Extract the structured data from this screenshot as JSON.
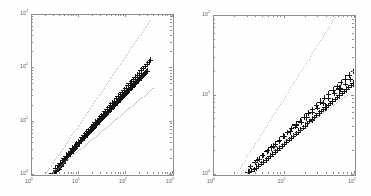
{
  "figure": {
    "background_color": "#fefefe",
    "axis_color": "#8d8d8d",
    "marker_color": "#141414",
    "guide_color": "#6f6f6f",
    "panel_count": 2
  },
  "chart_data": [
    {
      "type": "scatter",
      "title": "",
      "subtitle": "",
      "xlabel": "",
      "ylabel": "",
      "xscale": "log",
      "yscale": "log",
      "xlim": [
        1,
        1000
      ],
      "ylim": [
        1,
        1000
      ],
      "grid": false,
      "legend": null,
      "xtick_labels": [
        "10^0",
        "10^1",
        "10^2",
        "10^3"
      ],
      "ytick_labels": [
        "10^0",
        "10^1",
        "10^2",
        "10^3"
      ],
      "xticks": [
        1,
        10,
        100,
        1000
      ],
      "yticks": [
        1,
        10,
        100,
        1000
      ],
      "marker": "+",
      "annotations": [],
      "series": [
        {
          "name": "data",
          "marker": "+",
          "x": [
            2.9,
            3.1,
            3.2,
            3.4,
            3.5,
            3.6,
            3.8,
            3.9,
            4.0,
            4.2,
            4.4,
            4.5,
            4.7,
            4.9,
            5.1,
            5.3,
            5.5,
            5.8,
            6.0,
            6.3,
            6.6,
            6.9,
            7.2,
            7.5,
            7.9,
            8.2,
            8.6,
            9.0,
            9.4,
            9.8,
            10.3,
            10.8,
            11.3,
            11.8,
            12.4,
            13.0,
            13.6,
            14.2,
            14.9,
            15.6,
            16.4,
            17.2,
            18.0,
            18.9,
            19.8,
            20.8,
            21.8,
            22.8,
            24.0,
            25.1,
            26.4,
            27.7,
            29.0,
            30.5,
            32.0,
            33.6,
            35.2,
            37.0,
            38.8,
            40.7,
            42.8,
            44.9,
            47.2,
            49.5,
            52.0,
            54.6,
            57.4,
            60.3,
            63.3,
            66.5,
            69.9,
            73.4,
            77.1,
            81.0,
            85.1,
            89.4,
            93.9,
            98.6,
            103.6,
            108.9,
            114.4,
            120.2,
            126.3,
            132.7,
            139.4,
            146.5,
            153.9,
            161.7,
            169.9,
            178.5,
            187.5,
            197.0,
            207.0,
            217.5,
            228.5,
            240.0,
            252.2,
            265.0,
            278.4,
            292.5,
            3.3,
            3.7,
            4.1,
            4.6,
            5.0,
            5.6,
            6.2,
            6.8,
            7.6,
            8.4,
            9.2,
            10.1,
            11.1,
            12.2,
            13.4,
            14.7,
            16.1,
            17.7,
            19.4,
            21.3,
            23.4,
            25.7,
            28.2,
            31.0,
            34.0,
            37.3,
            41.0,
            45.0,
            49.4,
            54.2,
            59.5,
            65.3,
            71.7,
            78.7,
            86.4,
            94.9,
            104.2,
            114.4,
            125.6,
            137.9,
            151.4,
            166.2,
            182.5,
            200.4,
            220.0,
            241.5,
            265.2,
            291.2,
            319.7,
            351.0
          ],
          "y": [
            1.02,
            1.05,
            1.08,
            1.12,
            1.15,
            1.2,
            1.25,
            1.3,
            1.35,
            1.42,
            1.48,
            1.55,
            1.62,
            1.7,
            1.78,
            1.86,
            1.95,
            2.05,
            2.15,
            2.25,
            2.36,
            2.47,
            2.59,
            2.71,
            2.85,
            2.98,
            3.12,
            3.27,
            3.42,
            3.58,
            3.75,
            3.93,
            4.11,
            4.3,
            4.5,
            4.71,
            4.93,
            5.16,
            5.4,
            5.65,
            5.91,
            6.19,
            6.47,
            6.77,
            7.08,
            7.41,
            7.75,
            8.11,
            8.49,
            8.88,
            9.29,
            9.72,
            10.17,
            10.64,
            11.13,
            11.65,
            12.19,
            12.75,
            13.34,
            13.96,
            14.61,
            15.29,
            16.0,
            16.74,
            17.52,
            18.33,
            19.18,
            20.07,
            21.0,
            21.97,
            22.99,
            24.05,
            25.17,
            26.33,
            27.55,
            28.83,
            30.16,
            31.56,
            33.03,
            34.56,
            36.16,
            37.84,
            39.6,
            41.44,
            43.36,
            45.38,
            47.49,
            49.7,
            52.01,
            54.43,
            56.96,
            59.61,
            62.38,
            65.28,
            68.32,
            71.5,
            74.82,
            78.3,
            81.94,
            85.75,
            1.3,
            1.45,
            1.6,
            1.8,
            1.95,
            2.2,
            2.45,
            2.7,
            3.0,
            3.3,
            3.65,
            4.0,
            4.4,
            4.85,
            5.3,
            5.85,
            6.4,
            7.0,
            7.7,
            8.45,
            9.3,
            10.2,
            11.2,
            12.3,
            13.5,
            14.8,
            16.3,
            17.9,
            19.6,
            21.5,
            23.6,
            25.9,
            28.5,
            31.2,
            34.3,
            37.6,
            41.3,
            45.4,
            49.8,
            54.7,
            60.0,
            65.9,
            72.4,
            79.5,
            87.3,
            95.8,
            105.2,
            115.5,
            126.8,
            139.2
          ]
        },
        {
          "name": "upper-guide",
          "marker": ".",
          "style": "dotted",
          "x": [
            2.0,
            2.6,
            3.3,
            4.3,
            5.6,
            7.2,
            9.3,
            12.0,
            15.5,
            20.1,
            26.0,
            33.6,
            43.4,
            56.1,
            72.6,
            93.9,
            121.4,
            157.0,
            203.0,
            262.5,
            339.5
          ],
          "y": [
            1.0,
            1.4,
            1.95,
            2.72,
            3.8,
            5.3,
            7.4,
            10.3,
            14.4,
            20.1,
            28.0,
            39.1,
            54.5,
            76.0,
            106.0,
            148.0,
            206.5,
            288.0,
            401.8,
            560.5,
            782.0
          ]
        },
        {
          "name": "lower-guide",
          "marker": ".",
          "style": "dotted",
          "x": [
            2.5,
            3.3,
            4.3,
            5.6,
            7.3,
            9.6,
            12.5,
            16.3,
            21.3,
            27.8,
            36.3,
            47.4,
            61.9,
            80.8,
            105.5,
            137.7,
            179.8,
            234.7,
            306.4,
            400.0
          ],
          "y": [
            1.0,
            1.22,
            1.48,
            1.8,
            2.2,
            2.67,
            3.25,
            3.96,
            4.82,
            5.86,
            7.13,
            8.68,
            10.56,
            12.85,
            15.64,
            19.03,
            23.16,
            28.17,
            34.28,
            41.72
          ]
        }
      ]
    },
    {
      "type": "scatter",
      "title": "",
      "subtitle": "",
      "xlabel": "",
      "ylabel": "",
      "xscale": "log",
      "yscale": "log",
      "xlim": [
        1,
        100
      ],
      "ylim": [
        1,
        100
      ],
      "grid": false,
      "legend": null,
      "xtick_labels": [
        "10^0",
        "10^1",
        "10^2"
      ],
      "ytick_labels": [
        "10^0",
        "10^1",
        "10^2"
      ],
      "xticks": [
        1,
        10,
        100
      ],
      "yticks": [
        1,
        10,
        100
      ],
      "marker": "+",
      "annotations": [],
      "series": [
        {
          "name": "data",
          "marker": "+",
          "x": [
            3.2,
            3.5,
            3.8,
            4.1,
            4.4,
            4.8,
            5.2,
            5.6,
            6.0,
            6.5,
            7.0,
            7.6,
            8.2,
            8.8,
            9.5,
            10.2,
            11.0,
            11.9,
            12.8,
            13.8,
            14.9,
            16.1,
            17.3,
            18.7,
            20.1,
            21.7,
            23.4,
            25.2,
            27.2,
            29.3,
            31.6,
            34.1,
            36.7,
            39.6,
            42.7,
            46.0,
            49.6,
            53.5,
            57.6,
            62.1,
            67.0,
            72.2,
            77.8,
            83.9,
            90.4,
            97.5,
            3.4,
            3.9,
            4.5,
            5.1,
            5.8,
            6.7,
            7.6,
            8.7,
            10.0,
            11.4,
            13.0,
            14.9,
            17.0,
            19.5,
            22.3,
            25.5,
            29.1,
            33.3,
            38.1,
            43.5,
            49.8,
            56.9,
            65.0,
            74.3,
            85.0,
            97.2,
            4.2,
            5.0,
            6.0,
            7.2,
            8.6,
            10.3,
            12.4,
            14.8,
            17.7,
            21.2,
            25.4,
            30.4,
            36.4,
            43.6,
            52.2,
            62.5,
            74.8,
            89.6
          ],
          "y": [
            1.05,
            1.1,
            1.15,
            1.2,
            1.27,
            1.34,
            1.42,
            1.5,
            1.58,
            1.68,
            1.78,
            1.89,
            2.0,
            2.12,
            2.25,
            2.39,
            2.53,
            2.69,
            2.85,
            3.02,
            3.2,
            3.4,
            3.6,
            3.82,
            4.05,
            4.3,
            4.56,
            4.83,
            5.12,
            5.43,
            5.76,
            6.1,
            6.47,
            6.86,
            7.27,
            7.71,
            8.17,
            8.66,
            9.18,
            9.73,
            10.32,
            10.94,
            11.6,
            12.29,
            13.03,
            13.81,
            1.25,
            1.4,
            1.55,
            1.72,
            1.92,
            2.15,
            2.4,
            2.68,
            3.0,
            3.35,
            3.74,
            4.18,
            4.67,
            5.22,
            5.83,
            6.51,
            7.27,
            8.12,
            9.07,
            10.13,
            11.32,
            12.64,
            14.12,
            15.77,
            17.62,
            19.68,
            1.5,
            1.72,
            1.97,
            2.26,
            2.6,
            2.98,
            3.42,
            3.93,
            4.51,
            5.18,
            5.94,
            6.82,
            7.83,
            8.99,
            10.32,
            11.85,
            13.6,
            15.62
          ]
        },
        {
          "name": "upper-guide",
          "marker": ".",
          "style": "dotted",
          "x": [
            2.1,
            2.6,
            3.2,
            4.0,
            4.9,
            6.1,
            7.5,
            9.3,
            11.5,
            14.2,
            17.6,
            21.7,
            26.9,
            33.2,
            41.1,
            50.8,
            62.8,
            77.7,
            96.0
          ],
          "y": [
            1.0,
            1.35,
            1.82,
            2.45,
            3.3,
            4.45,
            6.0,
            8.1,
            10.9,
            14.7,
            19.8,
            26.7,
            36.0,
            48.5,
            65.4,
            88.1,
            118.8,
            160.1,
            215.8
          ]
        },
        {
          "name": "lower-guide",
          "marker": ".",
          "style": "dotted",
          "x": [
            2.4,
            3.1,
            4.0,
            5.2,
            6.7,
            8.7,
            11.2,
            14.5,
            18.8,
            24.3,
            31.4,
            40.6,
            52.5,
            67.9,
            87.8
          ],
          "y": [
            1.0,
            1.18,
            1.4,
            1.66,
            1.96,
            2.32,
            2.75,
            3.25,
            3.85,
            4.56,
            5.4,
            6.39,
            7.57,
            8.96,
            10.61
          ]
        }
      ]
    }
  ]
}
